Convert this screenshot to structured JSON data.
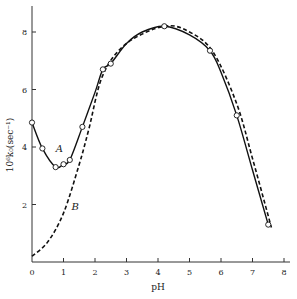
{
  "chart_data": {
    "type": "line",
    "title": "",
    "xlabel": "pH",
    "ylabel": "10⁶k₀(sec⁻¹)",
    "xlim": [
      0,
      8
    ],
    "ylim": [
      0,
      9
    ],
    "xticks": [
      0,
      1,
      2,
      3,
      4,
      5,
      6,
      7,
      8
    ],
    "yticks": [
      2,
      4,
      6,
      8
    ],
    "grid": false,
    "legend": "none",
    "annotations": [
      {
        "text": "A",
        "x": 0.75,
        "y": 3.95
      },
      {
        "text": "B",
        "x": 1.25,
        "y": 1.95
      }
    ],
    "series": [
      {
        "name": "A",
        "style": "solid",
        "curve": [
          [
            0,
            4.85
          ],
          [
            0.33,
            3.95
          ],
          [
            0.75,
            3.3
          ],
          [
            1.0,
            3.4
          ],
          [
            1.2,
            3.55
          ],
          [
            1.6,
            4.7
          ],
          [
            2.0,
            5.9
          ],
          [
            2.25,
            6.7
          ],
          [
            2.5,
            6.9
          ],
          [
            3.0,
            7.6
          ],
          [
            3.5,
            8.0
          ],
          [
            4.2,
            8.2
          ],
          [
            5.0,
            7.9
          ],
          [
            5.65,
            7.35
          ],
          [
            6.0,
            6.6
          ],
          [
            6.5,
            5.1
          ],
          [
            7.0,
            3.2
          ],
          [
            7.5,
            1.3
          ]
        ],
        "points": [
          [
            0,
            4.85
          ],
          [
            0.33,
            3.95
          ],
          [
            0.75,
            3.3
          ],
          [
            1.0,
            3.4
          ],
          [
            1.2,
            3.55
          ],
          [
            1.6,
            4.7
          ],
          [
            2.25,
            6.7
          ],
          [
            2.5,
            6.9
          ],
          [
            4.2,
            8.2
          ],
          [
            5.65,
            7.35
          ],
          [
            6.5,
            5.1
          ],
          [
            7.5,
            1.3
          ]
        ]
      },
      {
        "name": "B",
        "style": "dashed",
        "curve": [
          [
            0,
            0.2
          ],
          [
            0.5,
            0.7
          ],
          [
            1.0,
            1.7
          ],
          [
            1.5,
            3.4
          ],
          [
            1.8,
            4.6
          ],
          [
            2.25,
            6.5
          ],
          [
            3.0,
            7.6
          ],
          [
            4.2,
            8.2
          ],
          [
            5.0,
            8.0
          ],
          [
            5.75,
            7.3
          ],
          [
            6.5,
            5.5
          ],
          [
            7.0,
            3.6
          ],
          [
            7.6,
            1.2
          ]
        ],
        "points": []
      }
    ]
  }
}
